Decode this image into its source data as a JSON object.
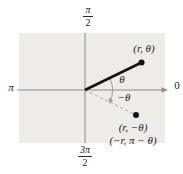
{
  "figure": {
    "colors": {
      "background": "#ffffff",
      "quadrant_box": "#edece9",
      "axis": "#8a8a8a",
      "ray": "#141414",
      "dashed_ray": "#b5b5b3",
      "arc": "#9a9a9a",
      "point": "#111111",
      "text": "#1b1b1b"
    },
    "axis_labels": {
      "right": "0",
      "left": "π",
      "top": {
        "numerator": "π",
        "denominator": "2"
      },
      "bottom": {
        "numerator": "3π",
        "denominator": "2"
      }
    },
    "point_labels": {
      "upper": "(r, θ)",
      "lower_primary": "(r, −θ)",
      "lower_secondary": "(−r, π − θ)"
    },
    "angle_labels": {
      "positive": "θ",
      "negative": "−θ"
    }
  }
}
